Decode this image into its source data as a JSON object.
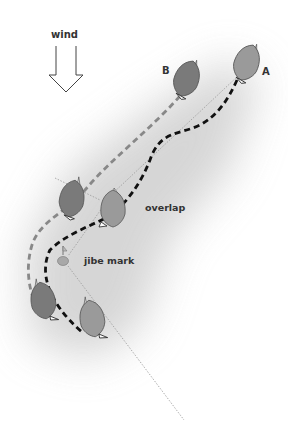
{
  "labels": {
    "wind": "wind",
    "boat_a": "A",
    "boat_b": "B",
    "overlap": "overlap",
    "jibe_mark": "jibe mark"
  },
  "colors": {
    "background": "#ffffff",
    "shade": "#d9d9d9",
    "boat_a_hull": "#9a9a9a",
    "boat_b_hull": "#7a7a7a",
    "path_a": "#111111",
    "path_b": "#888888",
    "layline": "#888888",
    "text": "#333333"
  },
  "boats": [
    {
      "id": "A",
      "position": "start",
      "x": 247,
      "y": 62
    },
    {
      "id": "B",
      "position": "start",
      "x": 187,
      "y": 78
    },
    {
      "id": "B",
      "position": "overlap",
      "x": 72,
      "y": 198
    },
    {
      "id": "A",
      "position": "overlap",
      "x": 113,
      "y": 208
    },
    {
      "id": "B",
      "position": "after-jibe",
      "x": 43,
      "y": 300
    },
    {
      "id": "A",
      "position": "after-jibe",
      "x": 92,
      "y": 318
    }
  ],
  "mark": {
    "x": 63,
    "y": 261
  }
}
